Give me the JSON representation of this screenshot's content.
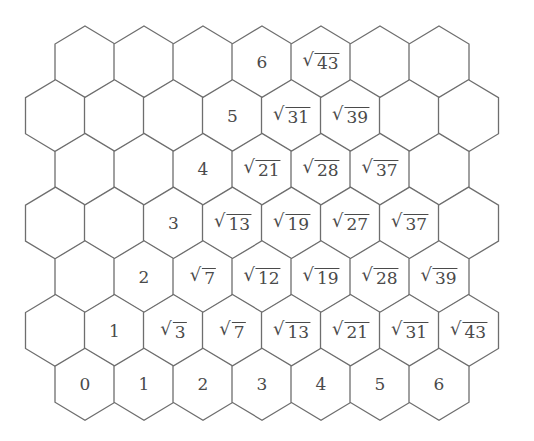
{
  "diagram": {
    "title": "",
    "colors": {
      "stroke": "#6e6e6e",
      "text": "#4a4a4a",
      "background": "#ffffff"
    },
    "geometry": {
      "even_row_first_center_x": 85,
      "odd_row_first_center_x": 55.5,
      "col_spacing": 59,
      "first_row_center_y": 62,
      "row_spacing": 53.7,
      "hex_half_width": 30,
      "hex_half_height": 36
    },
    "rows": [
      [
        "",
        "",
        "",
        "6",
        "√43",
        "",
        ""
      ],
      [
        "",
        "",
        "",
        "5",
        "√31",
        "√39",
        "",
        ""
      ],
      [
        "",
        "",
        "4",
        "√21",
        "√28",
        "√37",
        ""
      ],
      [
        "",
        "",
        "3",
        "√13",
        "√19",
        "√27",
        "√37",
        ""
      ],
      [
        "",
        "2",
        "√7",
        "√12",
        "√19",
        "√28",
        "√39"
      ],
      [
        "",
        "1",
        "√3",
        "√7",
        "√13",
        "√21",
        "√31",
        "√43"
      ],
      [
        "0",
        "1",
        "2",
        "3",
        "4",
        "5",
        "6"
      ]
    ]
  }
}
